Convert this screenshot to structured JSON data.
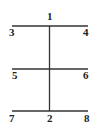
{
  "diagram": {
    "lines": [
      {
        "name": "top-horizontal",
        "from": "3",
        "to": "4",
        "x1": 12,
        "y1": 26,
        "x2": 88,
        "y2": 26
      },
      {
        "name": "middle-horizontal",
        "from": "5",
        "to": "6",
        "x1": 12,
        "y1": 69,
        "x2": 88,
        "y2": 69
      },
      {
        "name": "bottom-horizontal",
        "from": "7",
        "to": "8",
        "x1": 12,
        "y1": 111,
        "x2": 88,
        "y2": 111
      },
      {
        "name": "vertical",
        "from": "1",
        "to": "2",
        "x1": 49.5,
        "y1": 26,
        "x2": 49.5,
        "y2": 111
      }
    ],
    "labels": [
      {
        "text": "1",
        "x": 47,
        "y": 20
      },
      {
        "text": "3",
        "x": 9,
        "y": 36
      },
      {
        "text": "4",
        "x": 83,
        "y": 36
      },
      {
        "text": "5",
        "x": 12,
        "y": 79
      },
      {
        "text": "6",
        "x": 83,
        "y": 79
      },
      {
        "text": "7",
        "x": 9,
        "y": 122
      },
      {
        "text": "2",
        "x": 47,
        "y": 122
      },
      {
        "text": "8",
        "x": 84,
        "y": 122
      }
    ]
  }
}
